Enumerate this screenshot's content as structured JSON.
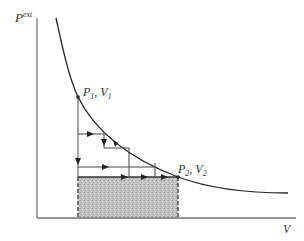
{
  "diagram": {
    "y_axis": {
      "label": "P",
      "superscript": "ext"
    },
    "x_axis": {
      "label": "V"
    },
    "points": [
      {
        "id": "state1",
        "p": "P",
        "p_sub": "1",
        "v": "V",
        "v_sub": "1",
        "sep": ", "
      },
      {
        "id": "state2",
        "p": "P",
        "p_sub": "2",
        "v": "V",
        "v_sub": "2",
        "sep": ", "
      }
    ],
    "shaded_region": "work done at constant P2 (rectangle under P2 from V1 to V2)",
    "colors": {
      "axis": "#777777",
      "curve": "#222222",
      "steps": "#444444",
      "shade": "#bdbdbd"
    }
  }
}
